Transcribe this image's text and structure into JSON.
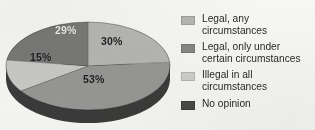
{
  "chart_data": {
    "type": "pie",
    "title": "",
    "subtitle": "",
    "xlabel": "",
    "ylabel": "",
    "legend_position": "right",
    "grid": false,
    "three_d": true,
    "categories": [
      "Legal, any circumstances",
      "Legal, only under certain circumstances",
      "Illegal in all circumstances",
      "No opinion"
    ],
    "values": [
      30,
      53,
      15,
      29
    ],
    "value_labels": [
      "30%",
      "53%",
      "15%",
      "29%"
    ],
    "colors": [
      "#b9b9b9",
      "#9a9a9a",
      "#cdcdcd",
      "#7b7b7b"
    ],
    "note": "Rendered slice percentages as printed on the figure; they are the labels shown on each wedge."
  },
  "pie": {
    "slices": [
      {
        "id": "slice-legal-any",
        "label": "30%",
        "value": 30,
        "category": "Legal, any circumstances",
        "fill": "#b9b9b9",
        "label_color": "dark",
        "label_x": 101,
        "label_y": 35
      },
      {
        "id": "slice-legal-certain",
        "label": "53%",
        "value": 53,
        "category": "Legal, only under certain circumstances",
        "fill": "#9a9a9a",
        "label_color": "dark",
        "label_x": 83,
        "label_y": 73
      },
      {
        "id": "slice-illegal-all",
        "label": "15%",
        "value": 15,
        "category": "Illegal in all circumstances",
        "fill": "#cdcdcd",
        "label_color": "dark",
        "label_x": 30,
        "label_y": 51
      },
      {
        "id": "slice-no-opinion",
        "label": "29%",
        "value": 29,
        "category": "No opinion",
        "fill": "#7b7b7b",
        "label_color": "light",
        "label_x": 55,
        "label_y": 24
      }
    ],
    "side_wall_color": "#3c3c3c",
    "side_wall_color_light": "#5a5a5a"
  },
  "legend": {
    "items": [
      {
        "label": "Legal, any circumstances",
        "color": "#b8b8b8"
      },
      {
        "label": "Legal, only under certain circumstances",
        "color": "#8a8a8a"
      },
      {
        "label": "Illegal in all circumstances",
        "color": "#d2d2d2"
      },
      {
        "label": "No opinion",
        "color": "#4a4a4a"
      }
    ]
  }
}
